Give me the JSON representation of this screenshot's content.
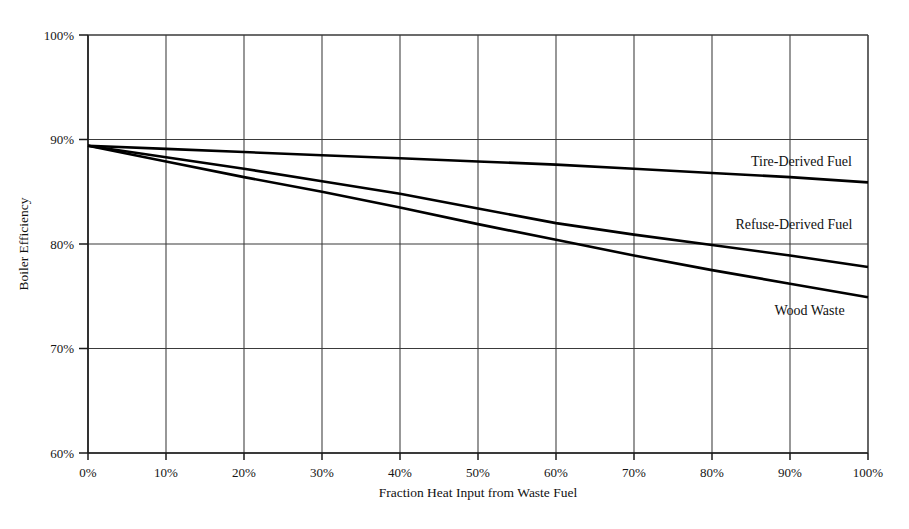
{
  "chart_data": {
    "type": "line",
    "title": "",
    "subtitle": "",
    "xlabel": "Fraction Heat Input from Waste Fuel",
    "ylabel": "Boiler Efficiency",
    "xlim": [
      0,
      100
    ],
    "ylim": [
      60,
      100
    ],
    "grid": true,
    "legend_position": "inline-right-of-line-ends",
    "x_ticks": [
      0,
      10,
      20,
      30,
      40,
      50,
      60,
      70,
      80,
      90,
      100
    ],
    "x_tick_labels": [
      "0%",
      "10%",
      "20%",
      "30%",
      "40%",
      "50%",
      "60%",
      "70%",
      "80%",
      "90%",
      "100%"
    ],
    "y_ticks": [
      60,
      70,
      80,
      90,
      100
    ],
    "y_tick_labels": [
      "60%",
      "70%",
      "80%",
      "90%",
      "100%"
    ],
    "x": [
      0,
      10,
      20,
      30,
      40,
      50,
      60,
      70,
      80,
      90,
      100
    ],
    "series": [
      {
        "name": "Tire-Derived Fuel",
        "values": [
          89.4,
          89.1,
          88.8,
          88.5,
          88.2,
          87.9,
          87.6,
          87.2,
          86.8,
          86.4,
          85.9
        ]
      },
      {
        "name": "Refuse-Derived Fuel",
        "values": [
          89.4,
          88.3,
          87.2,
          86.0,
          84.8,
          83.4,
          82.0,
          80.9,
          79.9,
          78.9,
          77.8
        ]
      },
      {
        "name": "Wood Waste",
        "values": [
          89.4,
          87.9,
          86.4,
          85.0,
          83.5,
          81.9,
          80.4,
          78.9,
          77.5,
          76.2,
          74.9
        ]
      }
    ],
    "annotations": [
      {
        "text": "Tire-Derived Fuel",
        "x": 85,
        "y": 87.5
      },
      {
        "text": "Refuse-Derived Fuel",
        "x": 83,
        "y": 81.4
      },
      {
        "text": "Wood Waste",
        "x": 88,
        "y": 73.2
      }
    ],
    "colors": {
      "line": "#000000",
      "grid": "#3a3a3a",
      "axis": "#1a1a1a",
      "background": "#ffffff",
      "text": "#111111"
    }
  }
}
